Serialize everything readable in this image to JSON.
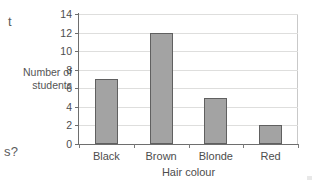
{
  "page": {
    "background_color": "#ffffff",
    "text_color": "#4d4d4d",
    "margin_fragments": {
      "top_left": "t",
      "bottom_left": "s?"
    }
  },
  "chart_data": {
    "type": "bar",
    "title": "",
    "xlabel": "Hair colour",
    "ylabel": "Number of students",
    "ylabel_lines": [
      "Number of",
      "students"
    ],
    "categories": [
      "Black",
      "Brown",
      "Blonde",
      "Red"
    ],
    "values": [
      7,
      12,
      5,
      2
    ],
    "ylim": [
      0,
      14
    ],
    "ytick_step": 2,
    "yticks": [
      0,
      2,
      4,
      6,
      8,
      10,
      12,
      14
    ],
    "ytick_labels": [
      "0",
      "2",
      "4",
      "6",
      "8",
      "10",
      "12",
      "14"
    ],
    "grid": true,
    "grid_orientation": "horizontal",
    "legend": false,
    "legend_position": "none",
    "bar_color": "#a3a3a3",
    "bar_border_color": "#606060",
    "gridline_color": "#dededd",
    "axis_color": "#6e6e6e"
  }
}
